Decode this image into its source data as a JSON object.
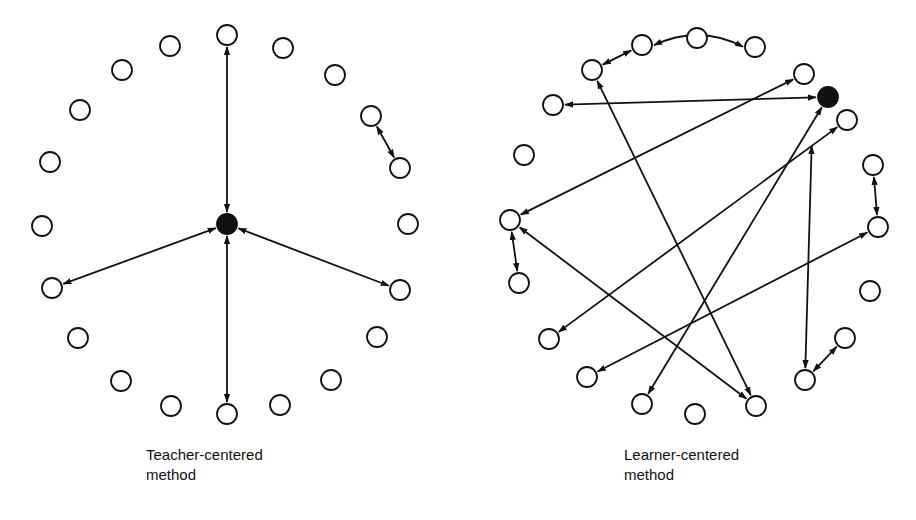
{
  "panels": [
    {
      "id": "teacher",
      "label_line1": "Teacher-centered",
      "label_line2": "method",
      "label_pos": [
        146,
        445
      ],
      "teacher_node": [
        227,
        224
      ],
      "nodes": [
        [
          227,
          35
        ],
        [
          170,
          46
        ],
        [
          283,
          48
        ],
        [
          122,
          70
        ],
        [
          335,
          75
        ],
        [
          80,
          110
        ],
        [
          371,
          116
        ],
        [
          50,
          162
        ],
        [
          400,
          168
        ],
        [
          42,
          226
        ],
        [
          408,
          224
        ],
        [
          52,
          288
        ],
        [
          400,
          290
        ],
        [
          78,
          338
        ],
        [
          377,
          337
        ],
        [
          121,
          381
        ],
        [
          331,
          380
        ],
        [
          171,
          406
        ],
        [
          280,
          405
        ],
        [
          227,
          414
        ]
      ],
      "edges": [
        {
          "from": [
            227,
            35
          ],
          "to": [
            227,
            224
          ],
          "curve": 0
        },
        {
          "from": [
            227,
            224
          ],
          "to": [
            52,
            288
          ],
          "curve": 0
        },
        {
          "from": [
            227,
            224
          ],
          "to": [
            400,
            290
          ],
          "curve": 0
        },
        {
          "from": [
            227,
            224
          ],
          "to": [
            227,
            414
          ],
          "curve": 0
        },
        {
          "from": [
            371,
            116
          ],
          "to": [
            400,
            168
          ],
          "curve": 0
        }
      ]
    },
    {
      "id": "learner",
      "label_line1": "Learner-centered",
      "label_line2": "method",
      "label_pos": [
        624,
        445
      ],
      "teacher_node": [
        828,
        97
      ],
      "nodes": [
        [
          697,
          38
        ],
        [
          642,
          45
        ],
        [
          755,
          47
        ],
        [
          592,
          70
        ],
        [
          804,
          74
        ],
        [
          553,
          105
        ],
        [
          847,
          120
        ],
        [
          524,
          155
        ],
        [
          873,
          165
        ],
        [
          510,
          220
        ],
        [
          878,
          227
        ],
        [
          519,
          283
        ],
        [
          870,
          291
        ],
        [
          549,
          339
        ],
        [
          845,
          338
        ],
        [
          587,
          377
        ],
        [
          805,
          380
        ],
        [
          642,
          404
        ],
        [
          756,
          406
        ],
        [
          695,
          414
        ]
      ],
      "edges": [
        {
          "from": [
            642,
            45
          ],
          "to": [
            592,
            70
          ],
          "curve": 0
        },
        {
          "from": [
            642,
            45
          ],
          "to": [
            755,
            47
          ],
          "curve": -22
        },
        {
          "from": [
            873,
            165
          ],
          "to": [
            878,
            227
          ],
          "curve": 0
        },
        {
          "from": [
            510,
            220
          ],
          "to": [
            519,
            283
          ],
          "curve": 0
        },
        {
          "from": [
            845,
            338
          ],
          "to": [
            805,
            380
          ],
          "curve": 0
        },
        {
          "from": [
            828,
            97
          ],
          "to": [
            553,
            105
          ],
          "curve": 0
        },
        {
          "from": [
            804,
            74
          ],
          "to": [
            510,
            220
          ],
          "curve": 0
        },
        {
          "from": [
            592,
            70
          ],
          "to": [
            756,
            406
          ],
          "curve": 0
        },
        {
          "from": [
            828,
            97
          ],
          "to": [
            642,
            404
          ],
          "curve": 0
        },
        {
          "from": [
            847,
            120
          ],
          "to": [
            549,
            339
          ],
          "curve": 0
        },
        {
          "from": [
            510,
            220
          ],
          "to": [
            756,
            406
          ],
          "curve": 0
        },
        {
          "from": [
            878,
            227
          ],
          "to": [
            587,
            377
          ],
          "curve": 0
        },
        {
          "from": [
            812,
            134
          ],
          "to": [
            805,
            380
          ],
          "curve": 0
        }
      ]
    }
  ],
  "style": {
    "stroke": "#111111",
    "node_radius": 10,
    "fill_teacher": "#111111"
  }
}
